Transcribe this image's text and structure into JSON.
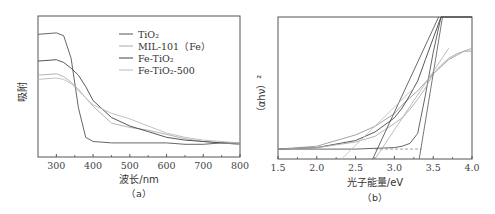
{
  "chart_data": [
    {
      "id": "a",
      "type": "line",
      "panel_label": "（a）",
      "title": "",
      "xlabel": "波长/nm",
      "ylabel": "吸附",
      "xlim": [
        250,
        800
      ],
      "ylim": [
        0,
        1
      ],
      "xticks": [
        300,
        400,
        500,
        600,
        700,
        800
      ],
      "grid": false,
      "legend_position": "upper right (inside)",
      "legend": [
        "TiO₂",
        "MIL-101（Fe）",
        "Fe-TiO₂",
        "Fe-TiO₂-500"
      ],
      "x": [
        250,
        300,
        320,
        340,
        360,
        380,
        400,
        450,
        500,
        550,
        600,
        650,
        700,
        750,
        800
      ],
      "series": [
        {
          "name": "TiO₂",
          "color": "#555555",
          "values": [
            0.87,
            0.88,
            0.86,
            0.7,
            0.35,
            0.14,
            0.11,
            0.1,
            0.1,
            0.1,
            0.1,
            0.09,
            0.09,
            0.1,
            0.09
          ]
        },
        {
          "name": "MIL-101（Fe）",
          "color": "#aaaaaa",
          "values": [
            0.58,
            0.59,
            0.57,
            0.53,
            0.48,
            0.42,
            0.36,
            0.24,
            0.21,
            0.19,
            0.16,
            0.13,
            0.11,
            0.1,
            0.09
          ]
        },
        {
          "name": "Fe-TiO₂",
          "color": "#444444",
          "values": [
            0.68,
            0.69,
            0.67,
            0.63,
            0.58,
            0.5,
            0.4,
            0.28,
            0.22,
            0.18,
            0.14,
            0.12,
            0.11,
            0.1,
            0.1
          ]
        },
        {
          "name": "Fe-TiO₂-500",
          "color": "#bbbbbb",
          "values": [
            0.55,
            0.56,
            0.55,
            0.52,
            0.47,
            0.42,
            0.37,
            0.31,
            0.27,
            0.22,
            0.17,
            0.14,
            0.12,
            0.11,
            0.1
          ]
        }
      ]
    },
    {
      "id": "b",
      "type": "line",
      "panel_label": "（b）",
      "title": "",
      "xlabel": "光子能量/eV",
      "ylabel": "（αhν）²",
      "xlim": [
        1.5,
        4.0
      ],
      "ylim": [
        0,
        1
      ],
      "xticks": [
        "1.5",
        "2.0",
        "2.5",
        "3.0",
        "3.5",
        "4.0"
      ],
      "grid": false,
      "x": [
        1.5,
        2.0,
        2.5,
        2.75,
        3.0,
        3.1,
        3.2,
        3.3,
        3.4,
        3.5,
        3.6,
        3.7,
        3.8,
        3.9,
        4.0
      ],
      "series": [
        {
          "name": "TiO₂",
          "color": "#555555",
          "values": [
            0.07,
            0.07,
            0.07,
            0.075,
            0.08,
            0.09,
            0.11,
            0.18,
            0.45,
            0.75,
            1.0,
            1.0,
            1.0,
            1.0,
            1.0
          ]
        },
        {
          "name": "MIL-101（Fe）",
          "color": "#999999",
          "values": [
            0.07,
            0.09,
            0.17,
            0.23,
            0.32,
            0.38,
            0.43,
            0.48,
            0.54,
            0.6,
            0.65,
            0.7,
            0.73,
            0.76,
            0.76
          ]
        },
        {
          "name": "Fe-TiO₂",
          "color": "#444444",
          "values": [
            0.07,
            0.08,
            0.13,
            0.19,
            0.29,
            0.36,
            0.45,
            0.55,
            0.7,
            0.85,
            1.0,
            1.0,
            1.0,
            1.0,
            1.0
          ]
        },
        {
          "name": "Fe-TiO₂-500",
          "color": "#aaaaaa",
          "values": [
            0.07,
            0.08,
            0.12,
            0.16,
            0.25,
            0.29,
            0.35,
            0.42,
            0.5,
            0.6,
            0.66,
            0.71,
            0.74,
            0.76,
            0.78
          ]
        }
      ],
      "tangent_lines": [
        {
          "name": "TiO₂ tangent",
          "x0_intercept": 3.32
        },
        {
          "name": "Fe-TiO₂ tangent",
          "x0_intercept": 2.72
        },
        {
          "name": "Fe-TiO₂-500 tangent",
          "x0_intercept": 2.75
        },
        {
          "name": "MIL-101（Fe） tangent",
          "x0_intercept": 2.32
        }
      ],
      "baseline": {
        "style": "dashed",
        "y": 0.07
      }
    }
  ]
}
